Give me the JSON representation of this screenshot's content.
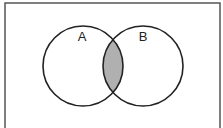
{
  "diagram": {
    "type": "venn",
    "sets": [
      {
        "label": "A",
        "cx": 83,
        "cy": 66,
        "r": 40
      },
      {
        "label": "B",
        "cx": 143,
        "cy": 66,
        "r": 40
      }
    ],
    "shaded_region": "A ∩ B",
    "colors": {
      "stroke": "#222222",
      "shade": "#b0b0b0",
      "frame": "#555555",
      "background": "#ffffff"
    }
  }
}
